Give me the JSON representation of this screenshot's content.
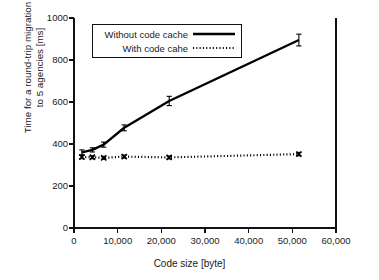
{
  "chart_data": {
    "type": "line",
    "title": "",
    "xlabel": "Code size [byte]",
    "ylabel": "Time for a round-trip migration\nto 5 agencies [ms]",
    "xlim": [
      0,
      60000
    ],
    "ylim": [
      0,
      1000
    ],
    "xticks": [
      0,
      10000,
      20000,
      30000,
      40000,
      50000,
      60000
    ],
    "xtick_labels": [
      "0",
      "10,000",
      "20,000",
      "30,000",
      "40,000",
      "50,000",
      "60,000"
    ],
    "yticks": [
      0,
      200,
      400,
      600,
      800,
      1000
    ],
    "ytick_labels": [
      "0",
      "200",
      "400",
      "600",
      "800",
      "1000"
    ],
    "grid": false,
    "legend_position": "upper left",
    "series": [
      {
        "name": "Without code cache",
        "style": "solid",
        "marker": "none",
        "color": "#000000",
        "x": [
          1800,
          4200,
          6800,
          11500,
          21800,
          51500
        ],
        "y": [
          360,
          372,
          397,
          477,
          605,
          895
        ],
        "yerr": [
          12,
          10,
          12,
          14,
          22,
          28
        ]
      },
      {
        "name": "With code cahe",
        "style": "dotted",
        "marker": "x",
        "color": "#000000",
        "x": [
          1800,
          4200,
          6800,
          11500,
          21800,
          51500
        ],
        "y": [
          338,
          337,
          334,
          340,
          336,
          352
        ],
        "yerr": [
          8,
          7,
          7,
          7,
          7,
          8
        ]
      }
    ]
  },
  "legend": {
    "entries": [
      {
        "label": "Without code cache",
        "style": "solid"
      },
      {
        "label": "With code cahe",
        "style": "dotted"
      }
    ]
  },
  "axes": {
    "x_title": "Code size [byte]",
    "y_title": "Time for a round-trip migration\nto 5 agencies [ms]"
  }
}
